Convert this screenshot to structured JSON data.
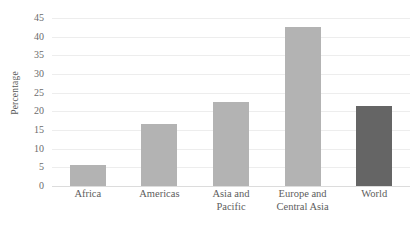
{
  "chart_data": {
    "type": "bar",
    "title": "",
    "subtitle": "",
    "xlabel": "",
    "ylabel": "Percentage",
    "categories": [
      "Africa",
      "Americas",
      "Asia and Pacific",
      "Europe and Central Asia",
      "World"
    ],
    "category_lines": [
      [
        "Africa"
      ],
      [
        "Americas"
      ],
      [
        "Asia and",
        "Pacific"
      ],
      [
        "Europe and",
        "Central Asia"
      ],
      [
        "World"
      ]
    ],
    "values": [
      5.5,
      16.5,
      22.5,
      42.5,
      21.5
    ],
    "ylim": [
      0,
      45
    ],
    "y_ticks": [
      0,
      5,
      10,
      15,
      20,
      25,
      30,
      35,
      40,
      45
    ],
    "y_tick_labels": [
      "0",
      "5",
      "10",
      "15",
      "20",
      "25",
      "30",
      "35",
      "40",
      "45"
    ],
    "grid": true,
    "legend": false,
    "legend_position": "none",
    "bar_colors": [
      "#b3b3b3",
      "#b3b3b3",
      "#b3b3b3",
      "#b3b3b3",
      "#656565"
    ],
    "colors": {
      "series_light": "#b3b3b3",
      "series_dark": "#656565",
      "gridline": "#ededed",
      "axis_line": "#dcdcdc",
      "tick_text": "#6b6b6b",
      "axis_title_text": "#5a5a5a",
      "background": "#ffffff"
    }
  }
}
